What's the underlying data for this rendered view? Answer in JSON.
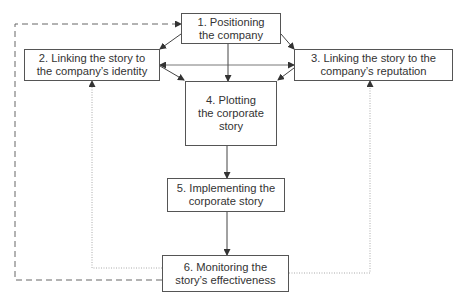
{
  "diagram": {
    "type": "process-flow",
    "nodes": [
      {
        "id": "1",
        "label": "1. Positioning the company",
        "lines": [
          "1. Positioning",
          "the company"
        ]
      },
      {
        "id": "2",
        "label": "2. Linking the story to the company's identity",
        "lines": [
          "2. Linking the story to",
          "the company’s identity"
        ]
      },
      {
        "id": "3",
        "label": "3. Linking the story to the company's reputation",
        "lines": [
          "3. Linking the story to the",
          "company’s reputation"
        ]
      },
      {
        "id": "4",
        "label": "4. Plotting the corporate story",
        "lines": [
          "4. Plotting",
          "the corporate",
          "story"
        ]
      },
      {
        "id": "5",
        "label": "5. Implementing the corporate story",
        "lines": [
          "5. Implementing the",
          "corporate story"
        ]
      },
      {
        "id": "6",
        "label": "6. Monitoring the story's effectiveness",
        "lines": [
          "6. Monitoring the",
          "story’s effectiveness"
        ]
      }
    ],
    "edges": [
      {
        "from": "1",
        "to": "2",
        "style": "solid"
      },
      {
        "from": "1",
        "to": "3",
        "style": "solid"
      },
      {
        "from": "1",
        "to": "4",
        "style": "solid"
      },
      {
        "from": "2",
        "to": "3",
        "style": "solid",
        "bidirectional": true
      },
      {
        "from": "2",
        "to": "4",
        "style": "solid"
      },
      {
        "from": "3",
        "to": "4",
        "style": "solid"
      },
      {
        "from": "4",
        "to": "5",
        "style": "solid"
      },
      {
        "from": "5",
        "to": "6",
        "style": "solid"
      },
      {
        "from": "6",
        "to": "1",
        "style": "dashed"
      },
      {
        "from": "6",
        "to": "2",
        "style": "dotted"
      },
      {
        "from": "6",
        "to": "3",
        "style": "dotted"
      }
    ],
    "colors": {
      "line": "#444444",
      "dotted": "#aaaaaa",
      "dashed": "#666666",
      "border": "#555555"
    }
  }
}
